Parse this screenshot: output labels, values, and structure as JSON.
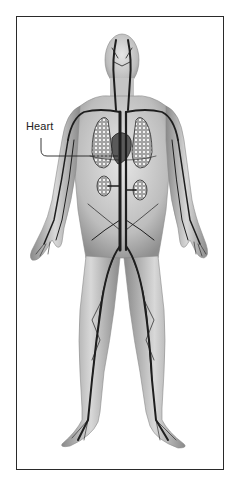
{
  "figure": {
    "labels": [
      {
        "id": "heart",
        "text": "Heart"
      }
    ],
    "colors": {
      "frame": "#2a2a2a",
      "skin": "#c8c8c8",
      "vessel": "#1e1e1e",
      "organ_fill": "#9a9a9a",
      "label_text": "#222222"
    }
  }
}
